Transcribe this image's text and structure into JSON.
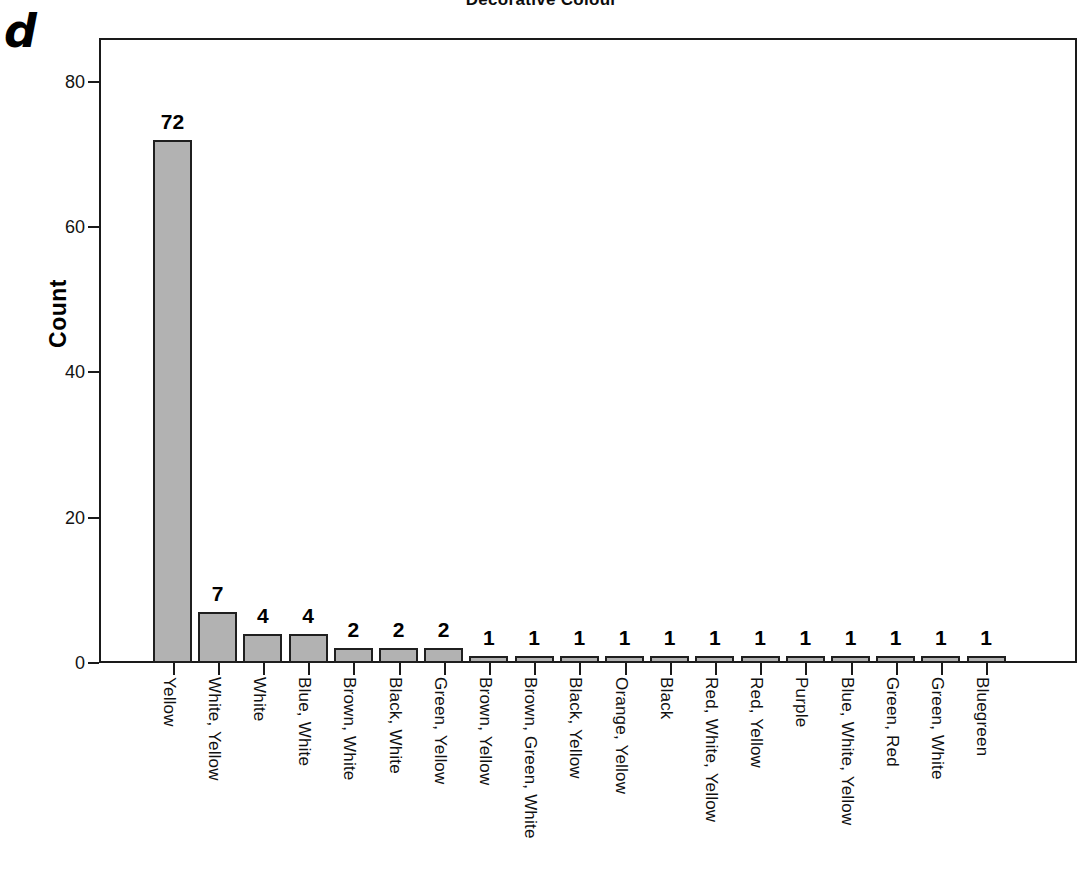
{
  "panel": {
    "letter": "d"
  },
  "chart_data": {
    "type": "bar",
    "title": "Decorative Colour",
    "xlabel": "",
    "ylabel": "Count",
    "ylim": [
      0,
      86
    ],
    "yticks": [
      0,
      20,
      40,
      60,
      80
    ],
    "ytick_labels": [
      "0",
      "20",
      "40",
      "60",
      "80"
    ],
    "grid": false,
    "legend": "none",
    "bar_fill_color": "#b2b2b2",
    "bar_edge_color": "#1f1f1f",
    "show_value_labels": true,
    "categories": [
      "Yellow",
      "White, Yellow",
      "White",
      "Blue, White",
      "Brown, White",
      "Black, White",
      "Green, Yellow",
      "Brown, Yellow",
      "Brown, Green, White",
      "Black, Yellow",
      "Orange, Yellow",
      "Black",
      "Red, White, Yellow",
      "Red, Yellow",
      "Purple",
      "Blue, White, Yellow",
      "Green, Red",
      "Green, White",
      "Bluegreen"
    ],
    "values": [
      72,
      7,
      4,
      4,
      2,
      2,
      2,
      1,
      1,
      1,
      1,
      1,
      1,
      1,
      1,
      1,
      1,
      1,
      1
    ],
    "value_labels": [
      "72",
      "7",
      "4",
      "4",
      "2",
      "2",
      "2",
      "1",
      "1",
      "1",
      "1",
      "1",
      "1",
      "1",
      "1",
      "1",
      "1",
      "1",
      "1"
    ]
  }
}
